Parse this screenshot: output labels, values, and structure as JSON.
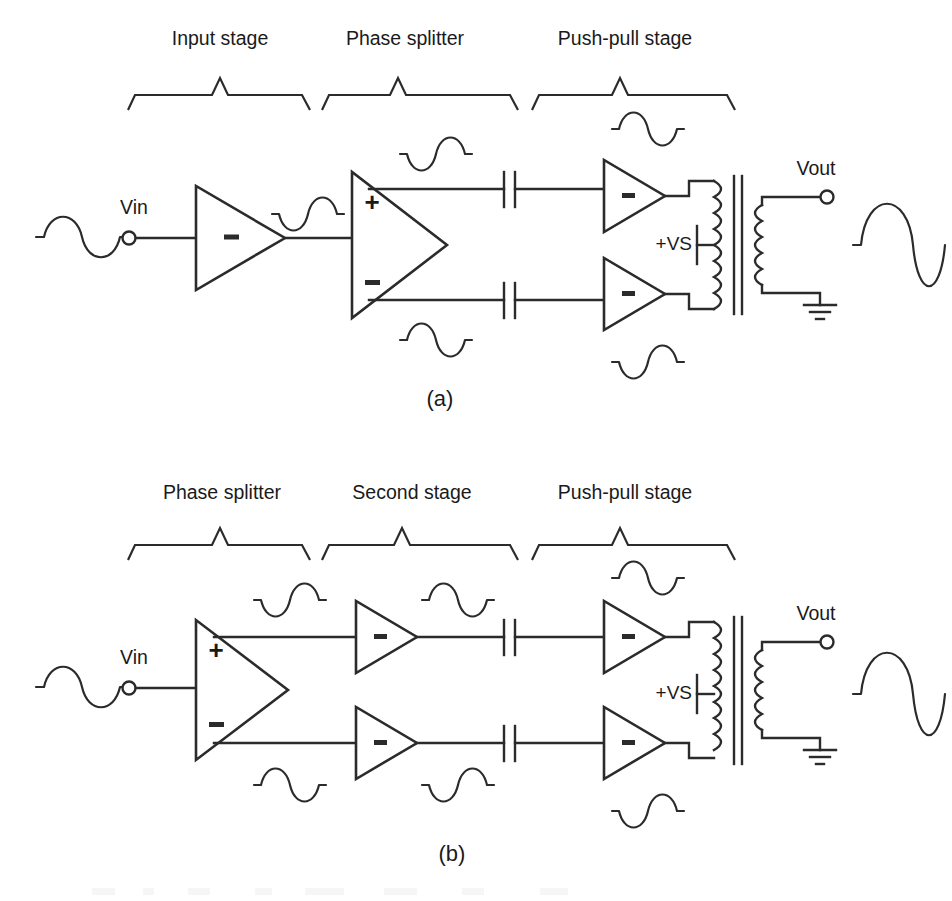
{
  "figure": {
    "caption_a": "(a)",
    "caption_b": "(b)",
    "background_color": "#ffffff",
    "line_color": "#2b2b2b"
  },
  "diagram_a": {
    "id": "a",
    "stage_labels": [
      "Input stage",
      "Phase splitter",
      "Push-pull stage"
    ],
    "signal_labels": {
      "input": "Vin",
      "output": "Vout",
      "supply": "+VS"
    },
    "blocks": [
      {
        "name": "input-stage-amplifier",
        "symbol": "-",
        "polarity": "inverting"
      },
      {
        "name": "phase-splitter-amplifier",
        "symbol_top": "+",
        "symbol_bottom": "-",
        "polarity": "differential"
      },
      {
        "name": "push-pull-amplifier-top",
        "symbol": "-",
        "polarity": "inverting"
      },
      {
        "name": "push-pull-amplifier-bottom",
        "symbol": "-",
        "polarity": "inverting"
      }
    ],
    "components": [
      {
        "name": "coupling-capacitor-top",
        "type": "capacitor"
      },
      {
        "name": "coupling-capacitor-bottom",
        "type": "capacitor"
      },
      {
        "name": "output-transformer",
        "type": "transformer",
        "center_tapped": true
      },
      {
        "name": "ground",
        "type": "ground-symbol"
      },
      {
        "name": "input-terminal",
        "type": "terminal"
      },
      {
        "name": "output-terminal",
        "type": "terminal"
      }
    ],
    "waveforms": [
      {
        "name": "waveform-input",
        "phase": "positive-first",
        "size": "small"
      },
      {
        "name": "waveform-input-stage-output",
        "phase": "negative-first",
        "size": "small"
      },
      {
        "name": "waveform-splitter-top-output",
        "phase": "negative-first",
        "size": "small"
      },
      {
        "name": "waveform-splitter-bottom-output",
        "phase": "positive-first",
        "size": "small"
      },
      {
        "name": "waveform-pushpull-top-output",
        "phase": "positive-first",
        "size": "small"
      },
      {
        "name": "waveform-pushpull-bottom-output",
        "phase": "negative-first",
        "size": "small"
      },
      {
        "name": "waveform-output",
        "phase": "positive-first",
        "size": "large"
      }
    ]
  },
  "diagram_b": {
    "id": "b",
    "stage_labels": [
      "Phase splitter",
      "Second stage",
      "Push-pull stage"
    ],
    "signal_labels": {
      "input": "Vin",
      "output": "Vout",
      "supply": "+VS"
    },
    "blocks": [
      {
        "name": "phase-splitter-amplifier",
        "symbol_top": "+",
        "symbol_bottom": "-",
        "polarity": "differential"
      },
      {
        "name": "second-stage-amplifier-top",
        "symbol": "-",
        "polarity": "inverting"
      },
      {
        "name": "second-stage-amplifier-bottom",
        "symbol": "-",
        "polarity": "inverting"
      },
      {
        "name": "push-pull-amplifier-top",
        "symbol": "-",
        "polarity": "inverting"
      },
      {
        "name": "push-pull-amplifier-bottom",
        "symbol": "-",
        "polarity": "inverting"
      }
    ],
    "components": [
      {
        "name": "coupling-capacitor-top",
        "type": "capacitor"
      },
      {
        "name": "coupling-capacitor-bottom",
        "type": "capacitor"
      },
      {
        "name": "output-transformer",
        "type": "transformer",
        "center_tapped": true
      },
      {
        "name": "ground",
        "type": "ground-symbol"
      },
      {
        "name": "input-terminal",
        "type": "terminal"
      },
      {
        "name": "output-terminal",
        "type": "terminal"
      }
    ],
    "waveforms": [
      {
        "name": "waveform-input",
        "phase": "positive-first",
        "size": "small"
      },
      {
        "name": "waveform-splitter-top-output",
        "phase": "negative-first",
        "size": "small"
      },
      {
        "name": "waveform-splitter-bottom-output",
        "phase": "positive-first",
        "size": "small"
      },
      {
        "name": "waveform-second-top-output",
        "phase": "positive-first",
        "size": "small"
      },
      {
        "name": "waveform-second-bottom-output",
        "phase": "negative-first",
        "size": "small"
      },
      {
        "name": "waveform-pushpull-top-output",
        "phase": "negative-first",
        "size": "small"
      },
      {
        "name": "waveform-pushpull-bottom-output",
        "phase": "positive-first",
        "size": "small"
      },
      {
        "name": "waveform-output",
        "phase": "positive-first",
        "size": "large"
      }
    ]
  }
}
